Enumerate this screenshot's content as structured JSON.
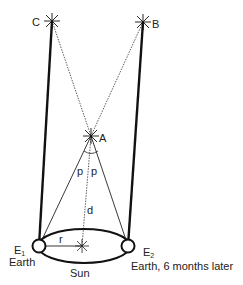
{
  "diagram": {
    "labels": {
      "star_c": "C",
      "star_b": "B",
      "star_a": "A",
      "angle_left": "p",
      "angle_right": "p",
      "distance": "d",
      "radius": "r",
      "sun": "Sun",
      "earth1_letter": "E",
      "earth1_sub": "1",
      "earth1_caption": "Earth",
      "earth2_letter": "E",
      "earth2_sub": "2",
      "earth2_caption": "Earth, 6 months later"
    },
    "points": {
      "C": [
        52,
        21
      ],
      "B": [
        143,
        22
      ],
      "A": [
        91,
        136
      ],
      "E1": [
        39,
        246
      ],
      "E2": [
        128,
        246
      ],
      "Sun": [
        82,
        246
      ]
    },
    "colors": {
      "line": "#111111",
      "text": "#222222",
      "background": "#ffffff"
    }
  }
}
